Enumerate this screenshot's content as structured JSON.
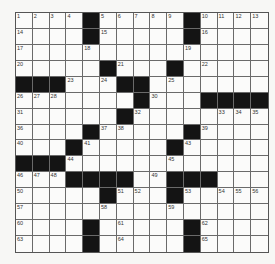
{
  "puzzle": {
    "size": 15,
    "colors": {
      "black_cell": "#141414",
      "white_cell": "#fbfbfa",
      "grid_line": "#6a6a6a"
    },
    "rows": [
      "....#.....#....",
      "....#.....#....",
      "...............",
      ".....#...#.....",
      "###...##.......",
      ".......#...####",
      "......#........",
      "....#.....#....",
      "...#.....#.....",
      "###............",
      "...####..###...",
      ".....#...#.....",
      "...............",
      "....#.....#....",
      "....#.....#...."
    ],
    "numbers": [
      [
        1,
        2,
        3,
        4,
        0,
        5,
        6,
        7,
        8,
        9,
        0,
        10,
        11,
        12,
        13
      ],
      [
        14,
        0,
        0,
        0,
        0,
        15,
        0,
        0,
        0,
        0,
        0,
        16,
        0,
        0,
        0
      ],
      [
        17,
        0,
        0,
        0,
        18,
        0,
        0,
        0,
        0,
        0,
        19,
        0,
        0,
        0,
        0
      ],
      [
        20,
        0,
        0,
        0,
        0,
        0,
        21,
        0,
        0,
        0,
        0,
        22,
        0,
        0,
        0
      ],
      [
        0,
        0,
        0,
        23,
        0,
        24,
        0,
        0,
        0,
        25,
        0,
        0,
        0,
        0,
        0
      ],
      [
        26,
        27,
        28,
        0,
        0,
        0,
        0,
        29,
        30,
        0,
        0,
        0,
        0,
        0,
        0
      ],
      [
        31,
        0,
        0,
        0,
        0,
        0,
        0,
        32,
        0,
        0,
        0,
        0,
        33,
        34,
        35
      ],
      [
        36,
        0,
        0,
        0,
        0,
        37,
        38,
        0,
        0,
        0,
        0,
        39,
        0,
        0,
        0
      ],
      [
        40,
        0,
        0,
        0,
        41,
        0,
        0,
        0,
        0,
        42,
        43,
        0,
        0,
        0,
        0
      ],
      [
        0,
        0,
        0,
        44,
        0,
        0,
        0,
        0,
        0,
        45,
        0,
        0,
        0,
        0,
        0
      ],
      [
        46,
        47,
        48,
        0,
        0,
        0,
        0,
        0,
        49,
        0,
        0,
        0,
        0,
        0,
        0
      ],
      [
        50,
        0,
        0,
        0,
        0,
        0,
        51,
        52,
        0,
        0,
        53,
        0,
        54,
        55,
        56
      ],
      [
        57,
        0,
        0,
        0,
        0,
        58,
        0,
        0,
        0,
        59,
        0,
        0,
        0,
        0,
        0
      ],
      [
        60,
        0,
        0,
        0,
        0,
        0,
        61,
        0,
        0,
        0,
        0,
        62,
        0,
        0,
        0
      ],
      [
        63,
        0,
        0,
        0,
        0,
        0,
        64,
        0,
        0,
        0,
        0,
        65,
        0,
        0,
        0
      ]
    ]
  }
}
